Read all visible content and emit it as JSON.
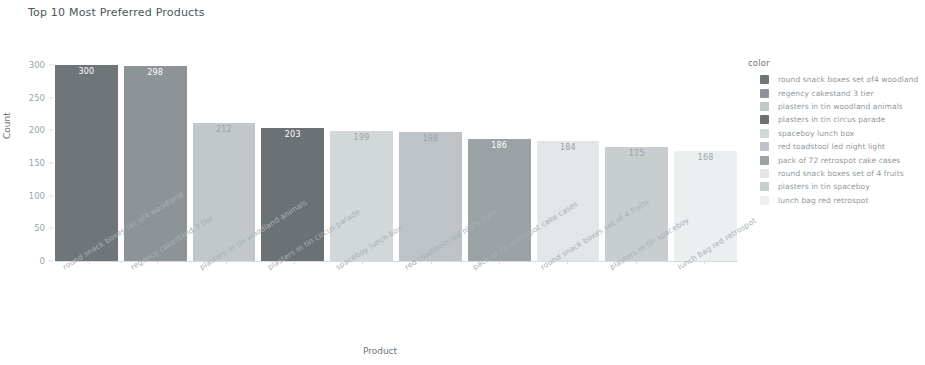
{
  "chart_data": {
    "type": "bar",
    "title": "Top 10 Most Preferred Products",
    "xlabel": "Product",
    "ylabel": "Count",
    "ylim": [
      0,
      300
    ],
    "yticks": [
      0,
      50,
      100,
      150,
      200,
      250,
      300
    ],
    "grid": false,
    "legend_position": "right",
    "legend_title": "color",
    "categories": [
      "round snack boxes set of4 woodland",
      "regency cakestand 3 tier",
      "plasters in tin woodland animals",
      "plasters in tin circus parade",
      "spaceboy lunch box",
      "red toadstool led night light",
      "pack of 72 retrospot cake cases",
      "round snack boxes set of 4 fruits",
      "plasters in tin spaceboy",
      "lunch bag red retrospot"
    ],
    "values": [
      300,
      298,
      212,
      203,
      199,
      198,
      186,
      184,
      175,
      168
    ],
    "bar_colors": [
      "#6f7679",
      "#8d9497",
      "#c2c7ca",
      "#6b7275",
      "#d2d7d9",
      "#bdc3c6",
      "#9ba2a5",
      "#e2e6e8",
      "#c8cdd0",
      "#eceff0"
    ]
  }
}
